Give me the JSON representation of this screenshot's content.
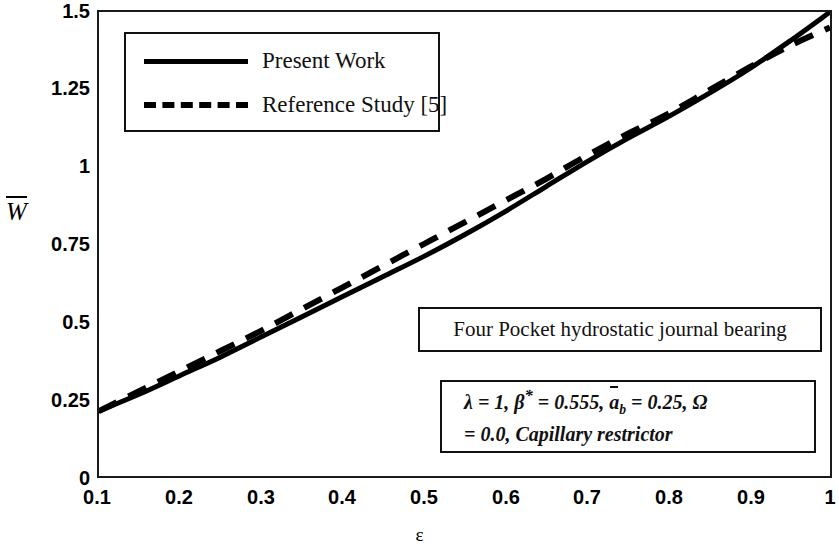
{
  "chart_data": {
    "type": "line",
    "title": "",
    "xlabel": "ε",
    "ylabel": "W̅",
    "xlim": [
      0.1,
      1.0
    ],
    "ylim": [
      0,
      1.5
    ],
    "xticks": [
      "0.1",
      "0.2",
      "0.3",
      "0.4",
      "0.5",
      "0.6",
      "0.7",
      "0.8",
      "0.9",
      "1"
    ],
    "yticks": [
      "0",
      "0.25",
      "0.5",
      "0.75",
      "1",
      "1.25",
      "1.5"
    ],
    "grid": false,
    "legend_position": "upper-left-inside",
    "x": [
      0.1,
      0.15,
      0.2,
      0.25,
      0.3,
      0.35,
      0.4,
      0.45,
      0.5,
      0.55,
      0.6,
      0.65,
      0.7,
      0.75,
      0.8,
      0.85,
      0.9,
      0.95,
      1.0
    ],
    "series": [
      {
        "name": "Present Work",
        "style": "solid",
        "color": "#000000",
        "values": [
          0.21,
          0.265,
          0.325,
          0.385,
          0.45,
          0.515,
          0.58,
          0.645,
          0.71,
          0.78,
          0.855,
          0.935,
          1.015,
          1.09,
          1.16,
          1.235,
          1.315,
          1.405,
          1.5
        ]
      },
      {
        "name": "Reference Study [5]",
        "style": "dashed",
        "color": "#000000",
        "values": [
          0.21,
          0.275,
          0.34,
          0.405,
          0.47,
          0.54,
          0.61,
          0.68,
          0.75,
          0.82,
          0.89,
          0.96,
          1.035,
          1.105,
          1.17,
          1.245,
          1.32,
          1.39,
          1.45
        ]
      }
    ]
  },
  "legend": {
    "entries": [
      {
        "label": "Present Work",
        "swatch": "solid-line-swatch"
      },
      {
        "label": "Reference Study [5]",
        "swatch": "dashed-line-swatch"
      }
    ]
  },
  "annotations": {
    "bearing_title": "Four Pocket hydrostatic journal bearing",
    "params_line1_pre": "λ = 1, β",
    "params_line1_star": "*",
    "params_line1_mid": " = 0.555, ",
    "params_abar": "a",
    "params_absub": "b",
    "params_line1_post": " = 0.25, Ω",
    "params_line2": "= 0.0, Capillary restrictor"
  }
}
